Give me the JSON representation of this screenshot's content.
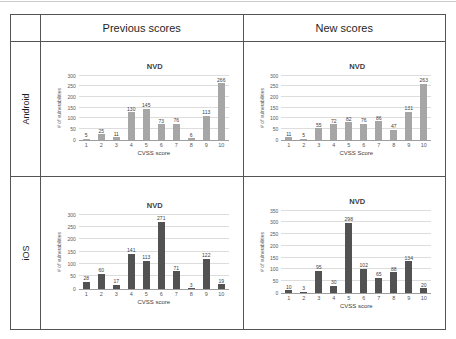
{
  "table": {
    "header": {
      "previous": "Previous scores",
      "new": "New scores"
    },
    "rows": [
      {
        "label": "Android"
      },
      {
        "label": "iOS"
      }
    ]
  },
  "colors": {
    "android_bar": "#a6a6a6",
    "ios_bar": "#525252",
    "gridline": "#dddddd",
    "table_border": "#545454"
  },
  "chart_data": [
    {
      "type": "bar",
      "panel_row": "Android",
      "panel_column": "Previous scores",
      "title": "NVD",
      "categories": [
        "1",
        "2",
        "3",
        "4",
        "5",
        "6",
        "7",
        "8",
        "9",
        "10"
      ],
      "values": [
        5,
        25,
        11,
        130,
        145,
        73,
        76,
        6,
        113,
        266
      ],
      "xlabel": "CVSS score",
      "ylabel": "# of vulnerabilities",
      "ylim": [
        0,
        300
      ],
      "yticks": [
        0,
        50,
        100,
        150,
        200,
        250,
        300
      ],
      "grid": true,
      "legend": false,
      "bar_color": "#a6a6a6"
    },
    {
      "type": "bar",
      "panel_row": "Android",
      "panel_column": "New scores",
      "title": "NVD",
      "categories": [
        "1",
        "2",
        "3",
        "4",
        "5",
        "6",
        "7",
        "8",
        "9",
        "10"
      ],
      "values": [
        11,
        5,
        55,
        72,
        82,
        76,
        86,
        47,
        131,
        263
      ],
      "xlabel": "CVSS Score",
      "ylabel": "# of vulnerabilities",
      "ylim": [
        0,
        300
      ],
      "yticks": [
        0,
        50,
        100,
        150,
        200,
        250,
        300
      ],
      "grid": true,
      "legend": false,
      "bar_color": "#a6a6a6"
    },
    {
      "type": "bar",
      "panel_row": "iOS",
      "panel_column": "Previous scores",
      "title": "NVD",
      "categories": [
        "1",
        "2",
        "3",
        "4",
        "5",
        "6",
        "7",
        "8",
        "9",
        "10"
      ],
      "values": [
        28,
        60,
        17,
        141,
        113,
        271,
        71,
        3,
        122,
        19
      ],
      "xlabel": "CVSS score",
      "ylabel": "# of vulnerabilities",
      "ylim": [
        0,
        300
      ],
      "yticks": [
        0,
        50,
        100,
        150,
        200,
        250,
        300
      ],
      "grid": true,
      "legend": false,
      "bar_color": "#525252"
    },
    {
      "type": "bar",
      "panel_row": "iOS",
      "panel_column": "New scores",
      "title": "NVD",
      "categories": [
        "1",
        "2",
        "3",
        "4",
        "5",
        "6",
        "7",
        "8",
        "9",
        "10"
      ],
      "values": [
        10,
        3,
        95,
        30,
        298,
        102,
        65,
        88,
        134,
        20
      ],
      "xlabel": "CVSS score",
      "ylabel": "# of vulnerabilities",
      "ylim": [
        0,
        350
      ],
      "yticks": [
        0,
        50,
        100,
        150,
        200,
        250,
        300,
        350
      ],
      "grid": true,
      "legend": false,
      "bar_color": "#525252"
    }
  ]
}
